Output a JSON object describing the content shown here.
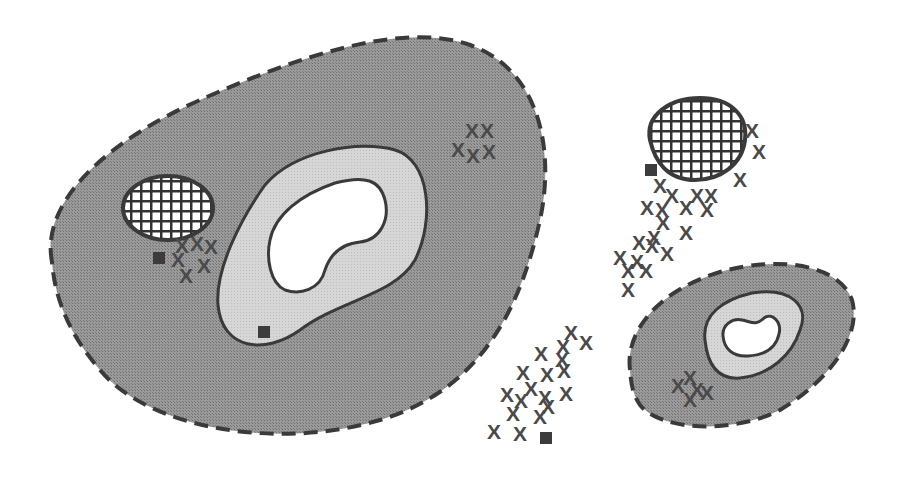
{
  "colors": {
    "background": "#ffffff",
    "outer_zone": "#8f8f8f",
    "middle_zone": "#d2d2d2",
    "inner_zone": "#ffffff",
    "outline": "#3a3a3a",
    "marker": "#4a4a4a",
    "square": "#3c3c3c"
  },
  "legend_symbols": {
    "x_marker": "X",
    "square_marker": "square",
    "hatched_patch": "crosshatch"
  },
  "regions": [
    {
      "id": "large-region",
      "outer_path": "M 52 262 C 40 200, 110 140, 200 100 C 290 60, 400 20, 470 45 C 540 70, 555 150, 540 220 C 520 310, 480 390, 380 420 C 280 450, 150 430, 100 370 C 70 335, 55 300, 52 262 Z",
      "middle_path": "M 218 305 C 215 270, 240 220, 265 185 C 295 150, 360 140, 395 150 C 430 160, 435 220, 415 260 C 395 295, 340 300, 300 330 C 265 355, 222 350, 218 305 Z",
      "inner_path": "M 270 240 C 275 215, 300 195, 335 183 C 365 175, 380 180, 385 200 C 390 220, 380 240, 360 242 C 340 244, 330 255, 325 270 C 320 290, 300 295, 285 290 C 270 283, 266 258, 270 240 Z",
      "hatched_ellipse": {
        "cx": 168,
        "cy": 208,
        "rx": 45,
        "ry": 32
      },
      "x_markers": [
        [
          472,
          131
        ],
        [
          487,
          131
        ],
        [
          458,
          150
        ],
        [
          473,
          156
        ],
        [
          489,
          152
        ],
        [
          182,
          246
        ],
        [
          197,
          244
        ],
        [
          211,
          247
        ],
        [
          178,
          260
        ],
        [
          204,
          266
        ],
        [
          186,
          276
        ]
      ],
      "squares": [
        [
          159,
          258
        ],
        [
          264,
          332
        ]
      ]
    },
    {
      "id": "small-region",
      "outer_path": "M 630 370 C 625 330, 660 290, 720 272 C 780 255, 840 265, 852 300 C 862 335, 830 380, 780 410 C 730 435, 660 430, 640 405 C 632 393, 631 382, 630 370 Z",
      "middle_path": "M 705 340 C 702 315, 722 300, 752 293 C 790 287, 810 305, 800 330 C 792 355, 770 375, 740 378 C 715 380, 707 360, 705 340 Z",
      "inner_path": "M 723 336 C 722 325, 732 318, 742 320 C 752 322, 756 326, 764 318 C 772 312, 782 322, 779 334 C 776 348, 765 355, 748 356 C 732 357, 724 348, 723 336 Z",
      "x_markers": [
        [
          690,
          378
        ],
        [
          678,
          386
        ],
        [
          697,
          390
        ],
        [
          707,
          393
        ],
        [
          690,
          400
        ]
      ],
      "squares": []
    }
  ],
  "floating_groups": [
    {
      "id": "upper-right-cluster",
      "hatched_blob_path": "M 650 140 C 645 115, 670 98, 700 98 C 730 98, 748 115, 745 140 C 742 165, 720 180, 695 180 C 668 180, 655 162, 650 140 Z",
      "x_markers": [
        [
          752,
          131
        ],
        [
          759,
          152
        ],
        [
          740,
          180
        ],
        [
          660,
          186
        ],
        [
          672,
          196
        ],
        [
          697,
          196
        ],
        [
          711,
          196
        ],
        [
          647,
          208
        ],
        [
          662,
          210
        ],
        [
          686,
          208
        ],
        [
          707,
          210
        ],
        [
          663,
          223
        ],
        [
          686,
          233
        ],
        [
          654,
          238
        ],
        [
          639,
          243
        ],
        [
          652,
          246
        ],
        [
          620,
          258
        ],
        [
          637,
          262
        ],
        [
          628,
          271
        ],
        [
          646,
          271
        ],
        [
          628,
          290
        ],
        [
          667,
          254
        ]
      ],
      "squares": [
        [
          651,
          170
        ]
      ]
    },
    {
      "id": "lower-middle-cluster",
      "hatched_blob_path": "",
      "x_markers": [
        [
          571,
          333
        ],
        [
          586,
          343
        ],
        [
          563,
          347
        ],
        [
          541,
          354
        ],
        [
          562,
          360
        ],
        [
          523,
          373
        ],
        [
          547,
          375
        ],
        [
          564,
          371
        ],
        [
          531,
          389
        ],
        [
          545,
          398
        ],
        [
          566,
          394
        ],
        [
          507,
          395
        ],
        [
          521,
          401
        ],
        [
          548,
          407
        ],
        [
          513,
          414
        ],
        [
          540,
          417
        ],
        [
          494,
          432
        ],
        [
          520,
          434
        ]
      ],
      "squares": [
        [
          546,
          438
        ]
      ]
    }
  ]
}
